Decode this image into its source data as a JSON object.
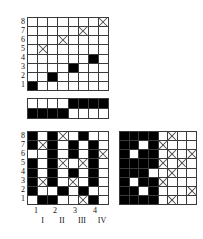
{
  "figure": {
    "colors": {
      "filled": "#000000",
      "empty": "#ffffff",
      "gridline": "#3a3a3a",
      "cross": "#4a4a4a"
    }
  },
  "top_grid": {
    "name": "top-grid",
    "rows": 8,
    "cols": 8,
    "row_labels": [
      "8",
      "7",
      "6",
      "5",
      "4",
      "3",
      "2",
      "1"
    ],
    "cells": [
      [
        "empty",
        "empty",
        "empty",
        "empty",
        "empty",
        "empty",
        "empty",
        "x"
      ],
      [
        "empty",
        "empty",
        "empty",
        "empty",
        "empty",
        "x",
        "empty",
        "empty"
      ],
      [
        "empty",
        "empty",
        "empty",
        "x",
        "empty",
        "empty",
        "empty",
        "empty"
      ],
      [
        "empty",
        "x",
        "empty",
        "empty",
        "empty",
        "empty",
        "empty",
        "empty"
      ],
      [
        "empty",
        "empty",
        "empty",
        "empty",
        "empty",
        "empty",
        "black",
        "empty"
      ],
      [
        "empty",
        "empty",
        "empty",
        "empty",
        "black",
        "empty",
        "empty",
        "empty"
      ],
      [
        "empty",
        "empty",
        "black",
        "empty",
        "empty",
        "empty",
        "empty",
        "empty"
      ],
      [
        "black",
        "empty",
        "empty",
        "empty",
        "empty",
        "empty",
        "empty",
        "empty"
      ]
    ]
  },
  "middle_bar": {
    "name": "middle-bar",
    "rows": 2,
    "cols": 8,
    "cells": [
      [
        "empty",
        "empty",
        "empty",
        "empty",
        "black",
        "black",
        "black",
        "black"
      ],
      [
        "black",
        "black",
        "black",
        "black",
        "empty",
        "empty",
        "empty",
        "empty"
      ]
    ]
  },
  "bottom_left_grid": {
    "name": "bottom-left-grid",
    "rows": 8,
    "cols": 8,
    "row_labels": [
      "8",
      "7",
      "6",
      "5",
      "4",
      "3",
      "2",
      "1"
    ],
    "cells": [
      [
        "black",
        "empty",
        "black",
        "x",
        "empty",
        "black",
        "empty",
        "empty"
      ],
      [
        "black",
        "x",
        "black",
        "empty",
        "black",
        "empty",
        "black",
        "empty"
      ],
      [
        "empty",
        "empty",
        "black",
        "empty",
        "black",
        "empty",
        "black",
        "x"
      ],
      [
        "black",
        "empty",
        "black",
        "x",
        "empty",
        "x",
        "black",
        "empty"
      ],
      [
        "black",
        "empty",
        "black",
        "empty",
        "black",
        "empty",
        "black",
        "empty"
      ],
      [
        "black",
        "x",
        "black",
        "empty",
        "x",
        "empty",
        "black",
        "empty"
      ],
      [
        "black",
        "empty",
        "empty",
        "black",
        "empty",
        "black",
        "empty",
        "empty"
      ],
      [
        "empty",
        "black",
        "black",
        "empty",
        "empty",
        "x",
        "black",
        "empty"
      ]
    ]
  },
  "bottom_right_grid": {
    "name": "bottom-right-grid",
    "rows": 8,
    "cols": 8,
    "cells": [
      [
        "black",
        "black",
        "black",
        "black",
        "empty",
        "x",
        "empty",
        "empty"
      ],
      [
        "black",
        "black",
        "empty",
        "black",
        "x",
        "empty",
        "empty",
        "empty"
      ],
      [
        "black",
        "empty",
        "black",
        "black",
        "empty",
        "x",
        "empty",
        "x"
      ],
      [
        "black",
        "black",
        "black",
        "black",
        "x",
        "empty",
        "x",
        "empty"
      ],
      [
        "black",
        "black",
        "black",
        "empty",
        "empty",
        "x",
        "empty",
        "empty"
      ],
      [
        "black",
        "empty",
        "black",
        "black",
        "x",
        "empty",
        "empty",
        "empty"
      ],
      [
        "black",
        "black",
        "empty",
        "black",
        "empty",
        "empty",
        "empty",
        "x"
      ],
      [
        "black",
        "black",
        "black",
        "black",
        "empty",
        "x",
        "empty",
        "empty"
      ]
    ]
  },
  "x_axis": {
    "name": "x-axis-labels",
    "numeric": [
      "1",
      "2",
      "3",
      "4"
    ],
    "roman": [
      "I",
      "II",
      "III",
      "IV"
    ]
  }
}
